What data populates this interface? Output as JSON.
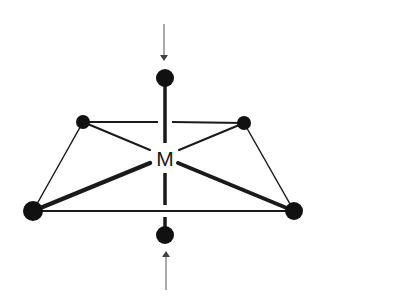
{
  "diagram": {
    "center_label": "M",
    "colors": {
      "background": "#ffffff",
      "atom": "#111111",
      "bond": "#1a1a1a",
      "arrow": "#555555"
    },
    "atoms": [
      {
        "id": "axial-top",
        "x": 165,
        "y": 78,
        "r": 9
      },
      {
        "id": "equatorial-back-left",
        "x": 83,
        "y": 122,
        "r": 7
      },
      {
        "id": "equatorial-back-right",
        "x": 244,
        "y": 123,
        "r": 7
      },
      {
        "id": "equatorial-front-left",
        "x": 33,
        "y": 211,
        "r": 10
      },
      {
        "id": "equatorial-front-right",
        "x": 294,
        "y": 211,
        "r": 9
      },
      {
        "id": "axial-bottom",
        "x": 165,
        "y": 235,
        "r": 9
      }
    ],
    "center": {
      "x": 165,
      "y": 158
    },
    "arrows": [
      {
        "id": "compression-arrow-top",
        "from": [
          164,
          24
        ],
        "to": [
          164,
          62
        ]
      },
      {
        "id": "compression-arrow-bottom",
        "from": [
          166,
          290
        ],
        "to": [
          166,
          250
        ]
      }
    ]
  }
}
